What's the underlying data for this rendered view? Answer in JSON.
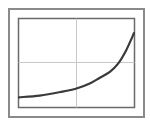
{
  "chart_data": {
    "type": "line",
    "title": "",
    "xlabel": "",
    "ylabel": "",
    "grid": true,
    "legend": null,
    "xlim": [
      0,
      1
    ],
    "ylim": [
      0,
      1
    ],
    "series": [
      {
        "name": "curve",
        "color": "#3a3a3a",
        "x": [
          0.0,
          0.18,
          0.36,
          0.5,
          0.62,
          0.7,
          0.79,
          0.86,
          0.93,
          1.0
        ],
        "y": [
          0.11,
          0.13,
          0.17,
          0.21,
          0.27,
          0.33,
          0.4,
          0.49,
          0.64,
          0.84
        ]
      }
    ]
  },
  "colors": {
    "frame": "#8a8a8a",
    "grid": "#c8c8c8",
    "line": "#3a3a3a",
    "background": "#ffffff"
  }
}
